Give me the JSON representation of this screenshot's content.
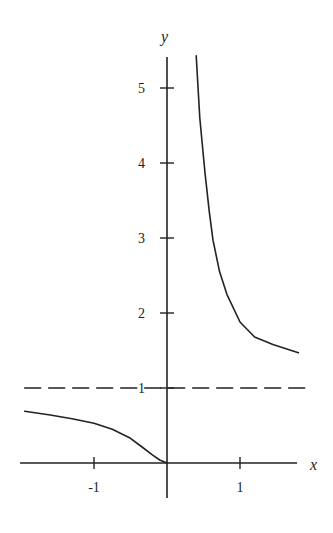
{
  "chart_data": {
    "type": "line",
    "title": "",
    "xlabel": "x",
    "ylabel": "y",
    "xlim": [
      -2.0,
      1.8
    ],
    "ylim": [
      -0.45,
      5.5
    ],
    "grid": false,
    "legend": null,
    "x_ticks": [
      {
        "value": -1,
        "label": "-1"
      },
      {
        "value": 1,
        "label": "1"
      }
    ],
    "y_ticks": [
      {
        "value": 1,
        "label": "1"
      },
      {
        "value": 2,
        "label": "2"
      },
      {
        "value": 3,
        "label": "3"
      },
      {
        "value": 4,
        "label": "4"
      },
      {
        "value": 5,
        "label": "5"
      }
    ],
    "series": [
      {
        "name": "left-branch",
        "style": "solid",
        "x": [
          -1.95,
          -1.6,
          -1.3,
          -1.0,
          -0.75,
          -0.5,
          -0.35,
          -0.2,
          -0.1,
          0.0
        ],
        "y": [
          0.69,
          0.64,
          0.59,
          0.53,
          0.45,
          0.33,
          0.22,
          0.11,
          0.04,
          0.0
        ]
      },
      {
        "name": "right-branch",
        "style": "solid",
        "x": [
          0.4,
          0.45,
          0.52,
          0.58,
          0.63,
          0.72,
          0.82,
          1.0,
          1.2,
          1.45,
          1.8
        ],
        "y": [
          5.43,
          4.6,
          3.87,
          3.35,
          2.97,
          2.55,
          2.25,
          1.88,
          1.68,
          1.58,
          1.47
        ]
      },
      {
        "name": "asymptote-y-1",
        "style": "dashed",
        "x": [
          -1.95,
          1.93
        ],
        "y": [
          1,
          1
        ]
      }
    ],
    "annotations": [
      {
        "text": "1",
        "at": "dashed asymptote label on y-axis"
      }
    ]
  },
  "labels": {
    "x_axis": "x",
    "y_axis": "y"
  },
  "colors": {
    "line": "#222222",
    "background": "#ffffff"
  }
}
